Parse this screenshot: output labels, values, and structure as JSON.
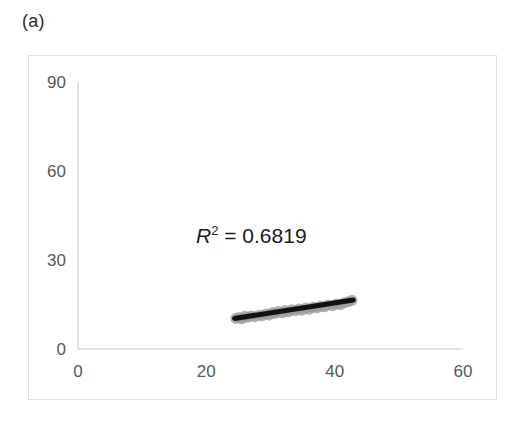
{
  "figure": {
    "panel_label": "(a)",
    "annotation": {
      "symbol": "R",
      "exponent": "2",
      "rest": " = 0.6819",
      "full_text": "R2 = 0.6819"
    }
  },
  "chart_data": {
    "type": "scatter",
    "title": "",
    "subtitle": "",
    "xlabel": "",
    "ylabel": "",
    "xlim": [
      0,
      60
    ],
    "ylim": [
      0,
      90
    ],
    "xticks": [
      0,
      20,
      40,
      60
    ],
    "yticks": [
      0,
      30,
      60,
      90
    ],
    "xtick_labels": [
      "0",
      "20",
      "40",
      "60"
    ],
    "ytick_labels": [
      "0",
      "30",
      "60",
      "90"
    ],
    "grid": false,
    "legend": false,
    "legend_position": "none",
    "annotations": [
      {
        "text": "R2 = 0.6819",
        "x": 26.5,
        "y": 37,
        "r_squared": 0.6819
      }
    ],
    "series": [
      {
        "name": "observations",
        "type": "scatter",
        "marker": "circle",
        "marker_color": "#9a9a9a",
        "marker_opacity": 0.75,
        "marker_size": 11,
        "points": [
          [
            24.6,
            10.3
          ],
          [
            25.1,
            10.6
          ],
          [
            25.5,
            10.2
          ],
          [
            26.0,
            11.0
          ],
          [
            26.4,
            10.7
          ],
          [
            27.0,
            11.1
          ],
          [
            27.6,
            10.9
          ],
          [
            28.2,
            11.4
          ],
          [
            28.7,
            11.2
          ],
          [
            29.3,
            11.8
          ],
          [
            29.8,
            11.5
          ],
          [
            30.3,
            12.3
          ],
          [
            30.7,
            12.0
          ],
          [
            31.2,
            12.6
          ],
          [
            31.8,
            12.2
          ],
          [
            32.3,
            13.0
          ],
          [
            32.8,
            12.5
          ],
          [
            33.3,
            13.2
          ],
          [
            33.9,
            12.9
          ],
          [
            34.4,
            13.5
          ],
          [
            34.9,
            13.1
          ],
          [
            35.5,
            13.8
          ],
          [
            36.0,
            13.4
          ],
          [
            36.6,
            14.1
          ],
          [
            37.2,
            13.9
          ],
          [
            37.8,
            14.4
          ],
          [
            38.4,
            14.2
          ],
          [
            39.0,
            14.8
          ],
          [
            39.7,
            14.6
          ],
          [
            40.3,
            15.2
          ],
          [
            40.9,
            15.0
          ],
          [
            41.5,
            15.6
          ],
          [
            42.1,
            15.9
          ],
          [
            42.7,
            16.4
          ]
        ]
      },
      {
        "name": "linear-trendline",
        "type": "line",
        "line_color": "#111111",
        "line_width": 5,
        "x_start": 24.4,
        "y_start": 10.3,
        "x_end": 42.9,
        "y_end": 16.5
      }
    ]
  },
  "colors": {
    "axis": "#d8d8d8",
    "frame": "#e2e2e2",
    "tick_text": "#58585a",
    "marker": "#9a9a9a",
    "trendline": "#111111",
    "annotation_text": "#1c1c1c"
  }
}
